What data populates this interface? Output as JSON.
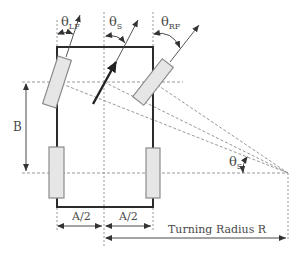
{
  "diagram": {
    "type": "Ackermann steering geometry",
    "labels": {
      "theta_lf": {
        "symbol": "θ",
        "sub": "LF"
      },
      "theta_s_top": {
        "symbol": "θ",
        "sub": "S"
      },
      "theta_rf": {
        "symbol": "θ",
        "sub": "RF"
      },
      "theta_s_icr": {
        "symbol": "θ",
        "sub": "S"
      },
      "wheelbase": "B",
      "half_track_left": "A/2",
      "half_track_right": "A/2",
      "turning_radius": "Turning Radius R"
    },
    "colors": {
      "chassis": "#2b2b2b",
      "wheel_fill": "#e6e6e6",
      "wheel_stroke": "#8a8a8a",
      "dashed": "#8c8c8c",
      "arrow": "#222222"
    }
  }
}
